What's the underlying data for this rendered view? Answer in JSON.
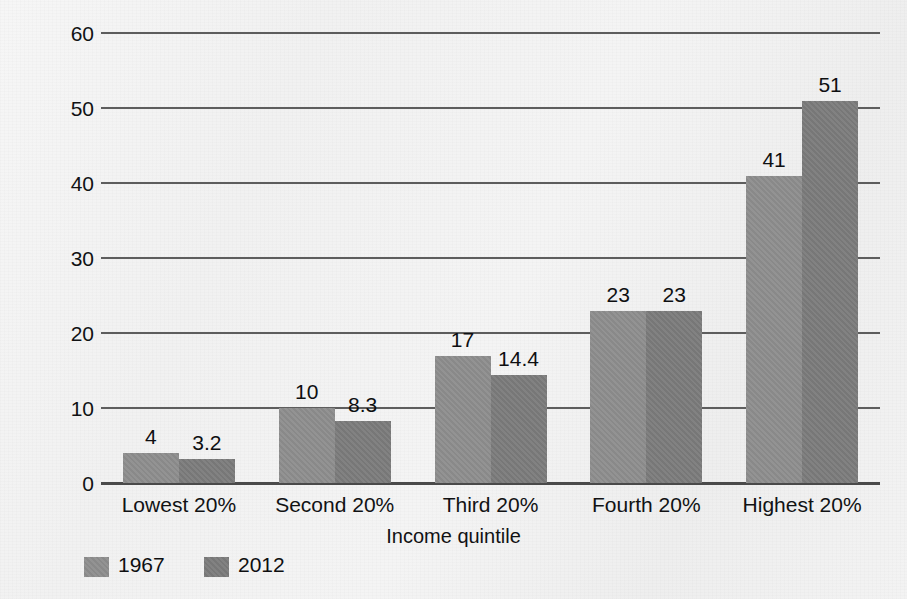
{
  "figure": {
    "title_remnant": "",
    "background_color": "#f2f2f2"
  },
  "chart_data": {
    "type": "bar",
    "title": "",
    "xlabel": "Income quintile",
    "ylabel": "Percentage of total family income",
    "categories": [
      "Lowest 20%",
      "Second 20%",
      "Third 20%",
      "Fourth 20%",
      "Highest 20%"
    ],
    "series": [
      {
        "name": "1967",
        "color": "#8d8d8d",
        "values": [
          4,
          10,
          17,
          23,
          41
        ],
        "labels": [
          "4",
          "10",
          "17",
          "23",
          "41"
        ]
      },
      {
        "name": "2012",
        "color": "#7b7b7b",
        "values": [
          3.2,
          8.3,
          14.4,
          23,
          51
        ],
        "labels": [
          "3.2",
          "8.3",
          "14.4",
          "23",
          "51"
        ]
      }
    ],
    "ylim": [
      0,
      60
    ],
    "yticks": [
      0,
      10,
      20,
      30,
      40,
      50,
      60
    ],
    "ytick_labels": [
      "0",
      "10",
      "20",
      "30",
      "40",
      "50",
      "60"
    ],
    "grid": true,
    "legend_position": "bottom-left",
    "legend": [
      {
        "label": "1967",
        "color": "#8d8d8d"
      },
      {
        "label": "2012",
        "color": "#7b7b7b"
      }
    ]
  }
}
